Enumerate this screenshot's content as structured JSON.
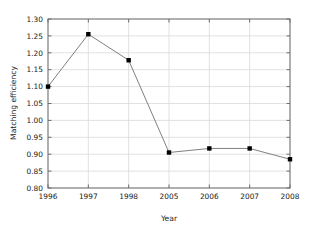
{
  "chart_data": {
    "type": "line",
    "title": "",
    "xlabel": "Year",
    "ylabel": "Matching efficiency",
    "categories": [
      "1996",
      "1997",
      "1998",
      "2005",
      "2006",
      "2007",
      "2008"
    ],
    "values": [
      1.1,
      1.255,
      1.178,
      0.905,
      0.917,
      0.917,
      0.885
    ],
    "series": [
      {
        "name": "Matching efficiency",
        "values": [
          1.1,
          1.255,
          1.178,
          0.905,
          0.917,
          0.917,
          0.885
        ]
      }
    ],
    "ylim": [
      0.8,
      1.3
    ],
    "ytick_labels": [
      "0.80",
      "0.85",
      "0.90",
      "0.95",
      "1.00",
      "1.05",
      "1.10",
      "1.15",
      "1.20",
      "1.25",
      "1.30"
    ],
    "ytick_values": [
      0.8,
      0.85,
      0.9,
      0.95,
      1.0,
      1.05,
      1.1,
      1.15,
      1.2,
      1.25,
      1.3
    ],
    "xtick_labels": [
      "1996",
      "1997",
      "1998",
      "2005",
      "2006",
      "2007",
      "2008"
    ],
    "grid": true,
    "legend": false,
    "legend_position": "none",
    "marker": "square",
    "marker_color": "#000000",
    "line_color": "#808080",
    "grid_color": "#d9d9d9",
    "frame_color": "#6e6e6e",
    "background_color": "#ffffff"
  },
  "axes": {
    "y_title": "Matching efficiency",
    "x_title": "Year"
  }
}
